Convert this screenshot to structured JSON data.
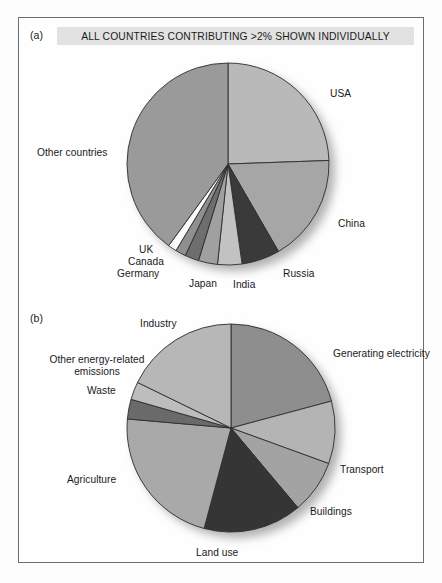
{
  "figure": {
    "background": "#fdfdfd",
    "frame_border_color": "#6d6d6d"
  },
  "panel_a": {
    "letter": "(a)",
    "banner_text": "ALL COUNTRIES CONTRIBUTING >2% SHOWN INDIVIDUALLY",
    "banner_bg": "#e2e2e2"
  },
  "panel_b": {
    "letter": "(b)"
  },
  "chart_data": [
    {
      "type": "pie",
      "id": "panel-a-pie",
      "title": "ALL COUNTRIES CONTRIBUTING >2% SHOWN INDIVIDUALLY",
      "legend_position": "callout-labels",
      "start_angle_deg": 0,
      "direction": "clockwise",
      "center": [
        228,
        164
      ],
      "radius": 101,
      "categories": [
        "USA",
        "China",
        "Russia",
        "India",
        "Japan",
        "Germany",
        "Canada",
        "UK",
        "Other countries"
      ],
      "values": [
        24.4,
        17.2,
        6.1,
        3.9,
        3.1,
        2.2,
        1.7,
        1.4,
        40.0
      ],
      "angles_deg": [
        88,
        62,
        22,
        14,
        11,
        8,
        6,
        5,
        144
      ],
      "colors": [
        "#b9b9b9",
        "#a6a6a6",
        "#3a3a3a",
        "#c2c2c2",
        "#a0a0a0",
        "#6e6e6e",
        "#8f8f8f",
        "#fbfbfb",
        "#9a9a9a"
      ],
      "labels": [
        {
          "text": "USA",
          "x": 330,
          "y": 88,
          "align": "left"
        },
        {
          "text": "China",
          "x": 338,
          "y": 218,
          "align": "left"
        },
        {
          "text": "Russia",
          "x": 283,
          "y": 268,
          "align": "left"
        },
        {
          "text": "India",
          "x": 233,
          "y": 279,
          "align": "left"
        },
        {
          "text": "Japan",
          "x": 189,
          "y": 278,
          "align": "left"
        },
        {
          "text": "Germany",
          "x": 117,
          "y": 268,
          "align": "left"
        },
        {
          "text": "Canada",
          "x": 128,
          "y": 256,
          "align": "left"
        },
        {
          "text": "UK",
          "x": 139,
          "y": 244,
          "align": "left"
        },
        {
          "text": "Other countries",
          "x": 37,
          "y": 147,
          "align": "left"
        }
      ]
    },
    {
      "type": "pie",
      "id": "panel-b-pie",
      "title": "",
      "legend_position": "callout-labels",
      "start_angle_deg": 0,
      "direction": "clockwise",
      "center": [
        231,
        428
      ],
      "radius": 104,
      "categories": [
        "Generating electricity",
        "Transport",
        "Buildings",
        "Land use",
        "Agriculture",
        "Waste",
        "Other energy-related emissions",
        "Industry"
      ],
      "values": [
        20.8,
        9.7,
        8.3,
        15.3,
        22.2,
        3.1,
        2.8,
        17.8
      ],
      "angles_deg": [
        75,
        35,
        30,
        55,
        80,
        11,
        10,
        64
      ],
      "colors": [
        "#8e8e8e",
        "#b4b4b4",
        "#a3a3a3",
        "#353535",
        "#a9a9a9",
        "#6a6a6a",
        "#bdbdbd",
        "#b7b7b7"
      ],
      "labels": [
        {
          "text": "Generating electricity",
          "x": 333,
          "y": 348,
          "align": "left"
        },
        {
          "text": "Transport",
          "x": 340,
          "y": 464,
          "align": "left"
        },
        {
          "text": "Buildings",
          "x": 310,
          "y": 506,
          "align": "left"
        },
        {
          "text": "Land use",
          "x": 196,
          "y": 547,
          "align": "left"
        },
        {
          "text": "Agriculture",
          "x": 67,
          "y": 474,
          "align": "left"
        },
        {
          "text": "Waste",
          "x": 87,
          "y": 385,
          "align": "left"
        },
        {
          "text": "Other energy-related emissions",
          "x": 37,
          "y": 354,
          "align": "center"
        },
        {
          "text": "Industry",
          "x": 140,
          "y": 318,
          "align": "left"
        }
      ]
    }
  ]
}
